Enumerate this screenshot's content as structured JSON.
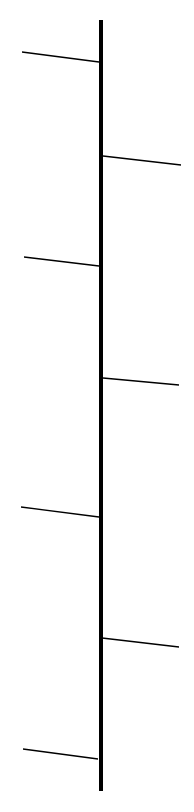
{
  "diagram": {
    "type": "fishbone-spine",
    "background": "#ffffff",
    "stroke_color": "#000000",
    "spine": {
      "x": 101,
      "y1": 20,
      "y2": 791,
      "width": 4
    },
    "branches": [
      {
        "side": "left",
        "x1": 22,
        "y1": 52,
        "x2": 99,
        "y2": 62
      },
      {
        "side": "right",
        "x1": 103,
        "y1": 156,
        "x2": 181,
        "y2": 165
      },
      {
        "side": "left",
        "x1": 24,
        "y1": 257,
        "x2": 99,
        "y2": 266
      },
      {
        "side": "right",
        "x1": 103,
        "y1": 378,
        "x2": 179,
        "y2": 385
      },
      {
        "side": "left",
        "x1": 21,
        "y1": 507,
        "x2": 99,
        "y2": 517
      },
      {
        "side": "right",
        "x1": 102,
        "y1": 638,
        "x2": 179,
        "y2": 647
      },
      {
        "side": "left",
        "x1": 23,
        "y1": 749,
        "x2": 98,
        "y2": 759
      }
    ],
    "branch_width": 1.3
  }
}
